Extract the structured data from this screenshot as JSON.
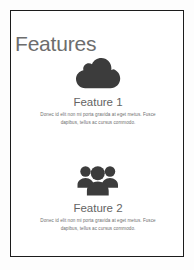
{
  "page": {
    "title": "Features",
    "accent_color": "#6d6d6d",
    "icon_color": "#3c3c3c",
    "body_text_color": "#6f6f6f",
    "border_color": "#1c1c1c",
    "background_color": "#ffffff"
  },
  "features": [
    {
      "icon": "cloud-icon",
      "heading": "Feature 1",
      "body": "Donec id elit non mi porta gravida at eget metus. Fusce dapibus, tellus ac cursus commodo."
    },
    {
      "icon": "users-icon",
      "heading": "Feature 2",
      "body": "Donec id elit non mi porta gravida at eget metus. Fusce dapibus, tellus ac cursus commodo."
    }
  ]
}
